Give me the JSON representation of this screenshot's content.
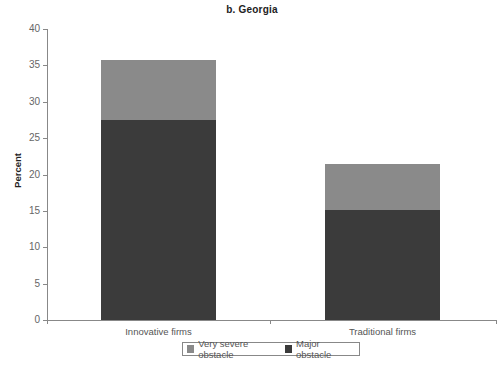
{
  "chart_data": {
    "type": "bar",
    "stacked": true,
    "title": "b. Georgia",
    "xlabel": "",
    "ylabel": "Percent",
    "ylim": [
      0,
      40
    ],
    "yticks": [
      0,
      5,
      10,
      15,
      20,
      25,
      30,
      35,
      40
    ],
    "categories": [
      "Innovative firms",
      "Traditional firms"
    ],
    "series": [
      {
        "name": "Major obstacle",
        "color": "#3b3b3b",
        "values": [
          27.5,
          15.1
        ]
      },
      {
        "name": "Very severe obstacle",
        "color": "#8a8a8a",
        "values": [
          8.2,
          6.3
        ]
      }
    ],
    "totals": [
      35.7,
      21.4
    ],
    "legend": {
      "position": "bottom",
      "entries": [
        "Very severe obstacle",
        "Major obstacle"
      ]
    },
    "grid": false
  },
  "labels": {
    "title": "b. Georgia",
    "ylabel": "Percent",
    "categories": [
      "Innovative firms",
      "Traditional firms"
    ],
    "legend": [
      "Very severe obstacle",
      "Major obstacle"
    ],
    "yticks": [
      "0",
      "5",
      "10",
      "15",
      "20",
      "25",
      "30",
      "35",
      "40"
    ]
  }
}
